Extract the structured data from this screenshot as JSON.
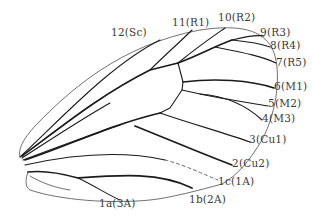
{
  "diagram": {
    "labels": [
      {
        "id": "sc",
        "text": "12(Sc)",
        "x": 111,
        "y": 27
      },
      {
        "id": "r1",
        "text": "11(R1)",
        "x": 172,
        "y": 17
      },
      {
        "id": "r2",
        "text": "10(R2)",
        "x": 218,
        "y": 12
      },
      {
        "id": "r3",
        "text": "9(R3)",
        "x": 260,
        "y": 27
      },
      {
        "id": "r4",
        "text": "8(R4)",
        "x": 270,
        "y": 40
      },
      {
        "id": "r5",
        "text": "7(R5)",
        "x": 276,
        "y": 57
      },
      {
        "id": "m1",
        "text": "6(M1)",
        "x": 274,
        "y": 81
      },
      {
        "id": "m2",
        "text": "5(M2)",
        "x": 268,
        "y": 98
      },
      {
        "id": "m3",
        "text": "4(M3)",
        "x": 262,
        "y": 113
      },
      {
        "id": "cu1",
        "text": "3(Cu1)",
        "x": 249,
        "y": 134
      },
      {
        "id": "cu2",
        "text": "2(Cu2)",
        "x": 232,
        "y": 158
      },
      {
        "id": "1a",
        "text": "1c(1A)",
        "x": 218,
        "y": 176
      },
      {
        "id": "2a",
        "text": "1b(2A)",
        "x": 189,
        "y": 194
      },
      {
        "id": "3a",
        "text": "1a(3A)",
        "x": 99,
        "y": 198
      }
    ]
  }
}
